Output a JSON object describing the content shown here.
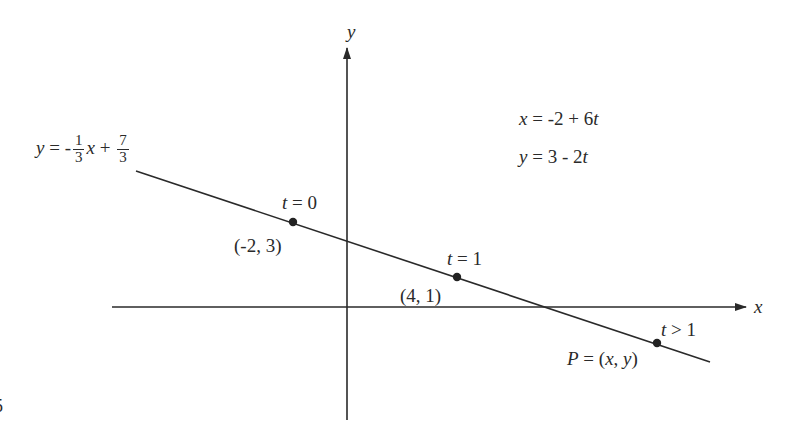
{
  "diagram": {
    "colors": {
      "ink": "#2a2a2a",
      "background": "#ffffff"
    },
    "axes": {
      "x_label": "x",
      "y_label": "y"
    },
    "line_equation": {
      "lhs": "y",
      "eq": "= -",
      "frac1_num": "1",
      "frac1_den": "3",
      "var": "x",
      "plus": "+",
      "frac2_num": "7",
      "frac2_den": "3"
    },
    "parametric": {
      "x_eq_lhs": "x",
      "x_eq_rhs": "= -2 + 6",
      "x_eq_t": "t",
      "y_eq_lhs": "y",
      "y_eq_rhs": "= 3 - 2",
      "y_eq_t": "t"
    },
    "points": [
      {
        "t_var": "t",
        "t_label": "= 0",
        "coord_label": "(-2, 3)"
      },
      {
        "t_var": "t",
        "t_label": "= 1",
        "coord_label": "(4, 1)"
      },
      {
        "t_var": "t",
        "t_label": "> 1",
        "coord_prefix": "P",
        "coord_label": "= (",
        "cx": "x",
        "comma": ", ",
        "cy": "y",
        "close": ")"
      }
    ],
    "margin_fragment": "5"
  }
}
